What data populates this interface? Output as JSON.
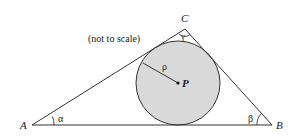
{
  "diagram": {
    "note": "(not to scale)",
    "vertices": {
      "A": {
        "label": "A",
        "x": 32,
        "y": 125
      },
      "B": {
        "label": "B",
        "x": 272,
        "y": 125
      },
      "C": {
        "label": "C",
        "x": 185,
        "y": 29
      }
    },
    "angles": {
      "alpha": "α",
      "beta": "β",
      "gamma": "γ"
    },
    "incircle": {
      "center_label": "P",
      "radius_label": "ρ",
      "cx": 178,
      "cy": 83,
      "r": 42,
      "fill": "#d9d9d9",
      "stroke": "#333333"
    },
    "line_color": "#333333"
  }
}
